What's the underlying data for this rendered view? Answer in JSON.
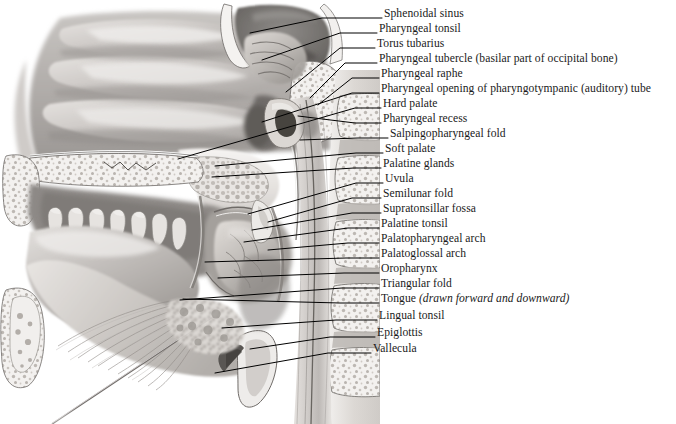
{
  "figure": {
    "caption": "",
    "background_color": "#ffffff",
    "ink_color": "#1a1a1a",
    "leader_color": "#000000"
  },
  "labels": [
    {
      "id": "sphenoidal-sinus",
      "text": "Sphenoidal sinus",
      "text_x": 384,
      "text_y": 17,
      "leader": [
        [
          382,
          18
        ],
        [
          322,
          18
        ],
        [
          250,
          33
        ]
      ]
    },
    {
      "id": "pharyngeal-tonsil",
      "text": "Pharyngeal tonsil",
      "text_x": 379,
      "text_y": 32,
      "leader": [
        [
          377,
          33
        ],
        [
          340,
          33
        ],
        [
          262,
          60
        ]
      ]
    },
    {
      "id": "torus-tubarius",
      "text": "Torus tubarius",
      "text_x": 377,
      "text_y": 47,
      "leader": [
        [
          375,
          48
        ],
        [
          340,
          48
        ],
        [
          286,
          92
        ]
      ]
    },
    {
      "id": "pharyngeal-tubercle",
      "text": "Pharyngeal tubercle (basilar part of occipital bone)",
      "text_x": 379,
      "text_y": 62,
      "leader": [
        [
          377,
          63
        ],
        [
          345,
          63
        ],
        [
          310,
          98
        ]
      ]
    },
    {
      "id": "pharyngeal-raphe",
      "text": "Pharyngeal raphe",
      "text_x": 381,
      "text_y": 77,
      "leader": [
        [
          379,
          78
        ],
        [
          352,
          78
        ],
        [
          318,
          105
        ]
      ]
    },
    {
      "id": "pharyngeal-opening",
      "text": "Pharyngeal opening of pharyngotympanic (auditory) tube",
      "text_x": 381,
      "text_y": 92,
      "leader": [
        [
          379,
          93
        ],
        [
          352,
          93
        ],
        [
          262,
          122
        ]
      ]
    },
    {
      "id": "hard-palate",
      "text": "Hard palate",
      "text_x": 383,
      "text_y": 107,
      "leader": [
        [
          381,
          108
        ],
        [
          355,
          108
        ],
        [
          178,
          159
        ]
      ]
    },
    {
      "id": "pharyngeal-recess",
      "text": "Pharyngeal recess",
      "text_x": 383,
      "text_y": 122,
      "leader": [
        [
          381,
          123
        ],
        [
          355,
          123
        ],
        [
          298,
          116
        ]
      ]
    },
    {
      "id": "salpingopharyngeal-fold",
      "text": "Salpingopharyngeal fold",
      "text_x": 390,
      "text_y": 137,
      "leader": [
        [
          388,
          138
        ],
        [
          358,
          138
        ],
        [
          300,
          140
        ]
      ]
    },
    {
      "id": "soft-palate",
      "text": "Soft palate",
      "text_x": 385,
      "text_y": 152,
      "leader": [
        [
          383,
          153
        ],
        [
          356,
          153
        ],
        [
          215,
          166
        ]
      ]
    },
    {
      "id": "palatine-glands",
      "text": "Palatine glands",
      "text_x": 383,
      "text_y": 167,
      "leader": [
        [
          381,
          168
        ],
        [
          354,
          168
        ],
        [
          212,
          177
        ]
      ]
    },
    {
      "id": "uvula",
      "text": "Uvula",
      "text_x": 385,
      "text_y": 182,
      "leader": [
        [
          383,
          183
        ],
        [
          356,
          183
        ],
        [
          248,
          214
        ]
      ]
    },
    {
      "id": "semilunar-fold",
      "text": "Semilunar fold",
      "text_x": 383,
      "text_y": 197,
      "leader": [
        [
          381,
          198
        ],
        [
          352,
          198
        ],
        [
          268,
          222
        ]
      ]
    },
    {
      "id": "supratonsillar-fossa",
      "text": "Supratonsillar fossa",
      "text_x": 383,
      "text_y": 212,
      "leader": [
        [
          381,
          213
        ],
        [
          352,
          213
        ],
        [
          252,
          230
        ]
      ]
    },
    {
      "id": "palatine-tonsil",
      "text": "Palatine tonsil",
      "text_x": 381,
      "text_y": 227,
      "leader": [
        [
          379,
          228
        ],
        [
          348,
          228
        ],
        [
          244,
          242
        ]
      ]
    },
    {
      "id": "palatopharyngeal-arch",
      "text": "Palatopharyngeal arch",
      "text_x": 381,
      "text_y": 242,
      "leader": [
        [
          379,
          243
        ],
        [
          348,
          243
        ],
        [
          268,
          250
        ]
      ]
    },
    {
      "id": "palatoglossal-arch",
      "text": "Palatoglossal arch",
      "text_x": 381,
      "text_y": 257,
      "leader": [
        [
          379,
          258
        ],
        [
          346,
          258
        ],
        [
          205,
          262
        ]
      ]
    },
    {
      "id": "oropharynx",
      "text": "Oropharynx",
      "text_x": 381,
      "text_y": 272,
      "leader": [
        [
          379,
          273
        ],
        [
          344,
          273
        ],
        [
          218,
          278
        ]
      ]
    },
    {
      "id": "triangular-fold",
      "text": "Triangular fold",
      "text_x": 381,
      "text_y": 287,
      "leader": [
        [
          379,
          288
        ],
        [
          342,
          288
        ],
        [
          180,
          300
        ]
      ]
    },
    {
      "id": "tongue",
      "text": "Tongue ",
      "text_italic": "(drawn forward and downward)",
      "text_x": 381,
      "text_y": 302,
      "leader": [
        [
          379,
          303
        ],
        [
          340,
          303
        ],
        [
          183,
          299
        ]
      ]
    },
    {
      "id": "lingual-tonsil",
      "text": "Lingual tonsil",
      "text_x": 379,
      "text_y": 319,
      "leader": [
        [
          377,
          320
        ],
        [
          336,
          320
        ],
        [
          222,
          328
        ]
      ]
    },
    {
      "id": "epiglottis",
      "text": "Epiglottis",
      "text_x": 377,
      "text_y": 336,
      "leader": [
        [
          375,
          337
        ],
        [
          330,
          337
        ],
        [
          250,
          349
        ]
      ]
    },
    {
      "id": "vallecula",
      "text": "Vallecula",
      "text_x": 373,
      "text_y": 352,
      "leader": [
        [
          371,
          353
        ],
        [
          328,
          353
        ],
        [
          215,
          373
        ]
      ]
    }
  ]
}
